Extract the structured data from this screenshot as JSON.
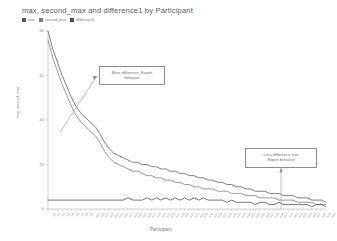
{
  "chart_data": {
    "type": "line",
    "title": "max, second_max and difference1 by Participant",
    "xlabel": "Participant",
    "ylabel": "max, second_max",
    "ylim": [
      0,
      80
    ],
    "yticks": [
      0,
      20,
      40,
      60,
      80
    ],
    "grid": false,
    "legend_position": "top-left",
    "categories": [
      "P1",
      "P2",
      "P3",
      "P4",
      "P5",
      "P6",
      "P7",
      "P8",
      "P9",
      "P10",
      "P11",
      "P12",
      "P13",
      "P14",
      "P15",
      "P16",
      "P17",
      "P18",
      "P19",
      "P20",
      "P21",
      "P22",
      "P23",
      "P24",
      "P25",
      "P26",
      "P27",
      "P28",
      "P29",
      "P30",
      "P31",
      "P32",
      "P33",
      "P34",
      "P35",
      "P36",
      "P37",
      "P38",
      "P39",
      "P40",
      "P41",
      "P42",
      "P43",
      "P44",
      "P45",
      "P46",
      "P47",
      "P48",
      "P49",
      "P50",
      "P51",
      "P52",
      "P53",
      "P54",
      "P55",
      "P56",
      "P57",
      "P58",
      "P59",
      "P60"
    ],
    "series": [
      {
        "name": "max",
        "color": "#555555",
        "values": [
          80,
          72,
          66,
          60,
          55,
          50,
          46,
          43,
          41,
          39,
          37,
          34,
          30,
          27,
          25,
          24,
          23,
          22,
          21,
          21,
          20,
          20,
          19,
          19,
          18,
          18,
          17,
          17,
          16,
          16,
          15,
          15,
          14,
          14,
          13,
          13,
          12,
          12,
          11,
          11,
          10,
          10,
          9,
          9,
          8,
          8,
          8,
          7,
          7,
          7,
          6,
          6,
          6,
          5,
          5,
          5,
          4,
          4,
          4,
          3
        ]
      },
      {
        "name": "second_max",
        "color": "#7a7a7a",
        "values": [
          76,
          68,
          62,
          56,
          51,
          46,
          42,
          39,
          37,
          35,
          33,
          30,
          26,
          23,
          21,
          20,
          19,
          18,
          17,
          17,
          16,
          15,
          15,
          14,
          14,
          13,
          13,
          12,
          12,
          11,
          11,
          10,
          10,
          9,
          9,
          9,
          8,
          8,
          8,
          7,
          7,
          7,
          6,
          6,
          6,
          5,
          5,
          5,
          5,
          4,
          4,
          4,
          4,
          3,
          3,
          3,
          3,
          2,
          2,
          2
        ]
      },
      {
        "name": "difference1",
        "color": "#4a4a4a",
        "values": [
          4,
          4,
          4,
          4,
          4,
          4,
          4,
          4,
          4,
          4,
          4,
          4,
          4,
          4,
          4,
          4,
          4,
          5,
          4,
          4,
          4,
          5,
          4,
          5,
          4,
          5,
          4,
          5,
          4,
          5,
          4,
          5,
          4,
          5,
          4,
          4,
          4,
          4,
          3,
          4,
          3,
          3,
          3,
          3,
          2,
          3,
          3,
          2,
          2,
          3,
          2,
          2,
          2,
          2,
          2,
          2,
          1,
          2,
          2,
          1
        ]
      }
    ],
    "annotations": [
      {
        "id": "expert",
        "line1": "More difference, Expert",
        "line2": "behavior"
      },
      {
        "id": "non-expert",
        "line1": "Less difference, non",
        "line2": "Expert behavior"
      }
    ]
  }
}
